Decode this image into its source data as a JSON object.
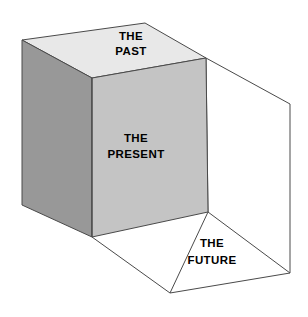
{
  "diagram": {
    "type": "3d-cuboid-time-metaphor",
    "background_color": "#ffffff",
    "stroke_color": "#4a4a4a",
    "stroke_width": 1,
    "faces": {
      "top": {
        "label_line1": "THE",
        "label_line2": "PAST",
        "fill": "#e8e8e8",
        "label_x": 131,
        "label_y1": 37,
        "label_y2": 52,
        "points": "22,40 145,23 206,58 92,78"
      },
      "left": {
        "label_line1": "",
        "label_line2": "",
        "fill": "#989898",
        "points": "22,40 92,78 92,237 22,205"
      },
      "front": {
        "label_line1": "THE",
        "label_line2": "PRESENT",
        "fill": "#c4c4c4",
        "label_x": 136,
        "label_y1": 139,
        "label_y2": 155,
        "points": "92,78 206,58 208,212 92,237"
      },
      "future": {
        "label_line1": "THE",
        "label_line2": "FUTURE",
        "fill": "#ffffff",
        "label_x": 212,
        "label_y1": 244,
        "label_y2": 261
      }
    },
    "wireframe_vertices": {
      "top_back_left": "22,40",
      "top_back_apex": "145,23",
      "top_right": "206,58",
      "top_front": "92,78",
      "bottom_back_left": "22,205",
      "bottom_front": "92,237",
      "far_right_top": "290,104",
      "far_right_bottom": "290,273",
      "bottom_front_right": "170,293"
    },
    "edges": [
      "top_right -> far_right_top",
      "far_right_top -> far_right_bottom",
      "far_right_bottom -> bottom_front_right",
      "bottom_front_right -> bottom_front",
      "present_bottom_right -> far_right_bottom",
      "present_bottom_right -> bottom_front_right",
      "top_front -> bottom_front"
    ]
  }
}
